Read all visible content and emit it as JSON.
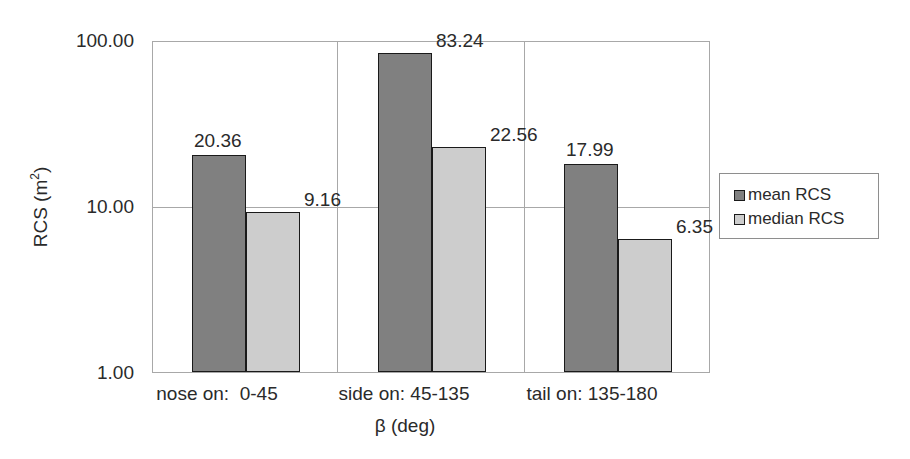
{
  "chart_data": {
    "type": "bar",
    "title": "",
    "xlabel": "β (deg)",
    "ylabel": "RCS (m2)",
    "ylabel_base": "RCS (m",
    "ylabel_sup": "2",
    "ylabel_tail": ")",
    "categories": [
      "nose on:  0-45",
      "side on: 45-135",
      "tail on: 135-180"
    ],
    "yscale": "log",
    "ylim": [
      1,
      100
    ],
    "yticks": [
      "1.00",
      "10.00",
      "100.00"
    ],
    "ytick_values": [
      1,
      10,
      100
    ],
    "grid": true,
    "legend_position": "right",
    "series": [
      {
        "name": "mean RCS",
        "color": "#808080",
        "values": [
          20.36,
          83.24,
          17.99
        ],
        "labels": [
          "20.36",
          "83.24",
          "17.99"
        ]
      },
      {
        "name": "median RCS",
        "color": "#cdcdcd",
        "values": [
          9.16,
          22.56,
          6.35
        ],
        "labels": [
          "9.16",
          "22.56",
          "6.35"
        ]
      }
    ]
  },
  "axis": {
    "y_tick_100": "100.00",
    "y_tick_10": "10.00",
    "y_tick_1": "1.00"
  },
  "legend": {
    "items": [
      {
        "label": "mean RCS",
        "color": "#808080"
      },
      {
        "label": "median RCS",
        "color": "#cdcdcd"
      }
    ]
  }
}
